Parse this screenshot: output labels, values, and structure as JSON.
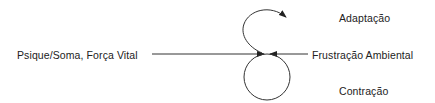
{
  "diagram": {
    "labels": {
      "source": "Psique/Soma, Força Vital",
      "opposing": "Frustração Ambiental",
      "upper_outcome": "Adaptação",
      "lower_outcome": "Contração"
    },
    "colors": {
      "line": "#333333",
      "text": "#222222",
      "background": "#ffffff"
    }
  }
}
